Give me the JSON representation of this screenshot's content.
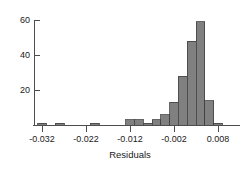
{
  "chart_data": {
    "type": "bar",
    "title": "",
    "subtitle": "",
    "xlabel": "Residuals",
    "ylabel": "",
    "grid": false,
    "legend": "none",
    "xlim": [
      -0.034,
      0.0108
    ],
    "ylim": [
      0,
      62
    ],
    "x_ticks": [
      -0.032,
      -0.022,
      -0.012,
      -0.002,
      0.008
    ],
    "x_tick_labels": [
      "-0.032",
      "-0.022",
      "-0.012",
      "-0.002",
      "0.008"
    ],
    "y_ticks": [
      20,
      40,
      60
    ],
    "y_tick_labels": [
      "20",
      "40",
      "60"
    ],
    "bin_width": 0.002,
    "bar_fill_color": "#808080",
    "bar_edge_color": "#404040",
    "axis_color": "#4d4d4d",
    "background_color": "#ffffff",
    "bin_edges": [
      -0.033,
      -0.031,
      -0.029,
      -0.027,
      -0.025,
      -0.023,
      -0.021,
      -0.019,
      -0.017,
      -0.015,
      -0.013,
      -0.011,
      -0.009,
      -0.007,
      -0.005,
      -0.003,
      -0.001,
      0.001,
      0.003,
      0.005,
      0.007,
      0.009
    ],
    "bin_centers": [
      -0.032,
      -0.03,
      -0.028,
      -0.026,
      -0.024,
      -0.022,
      -0.02,
      -0.018,
      -0.016,
      -0.014,
      -0.012,
      -0.01,
      -0.008,
      -0.006,
      -0.004,
      -0.002,
      0.0,
      0.002,
      0.004,
      0.006,
      0.008
    ],
    "categories": [
      "-0.0320",
      "-0.0300",
      "-0.0280",
      "-0.0260",
      "-0.0240",
      "-0.0220",
      "-0.0200",
      "-0.0180",
      "-0.0160",
      "-0.0140",
      "-0.0120",
      "-0.0100",
      "-0.0080",
      "-0.0060",
      "-0.0040",
      "-0.0020",
      "0.0000",
      "0.0020",
      "0.0040",
      "0.0060",
      "0.0080"
    ],
    "values": [
      1,
      0,
      1,
      0,
      0,
      0,
      1,
      0,
      0,
      0,
      3,
      3,
      1,
      3,
      6,
      13,
      28,
      48,
      59,
      14,
      1
    ]
  },
  "axes": {
    "x_axis_name": "x-axis",
    "y_axis_name": "y-axis"
  }
}
